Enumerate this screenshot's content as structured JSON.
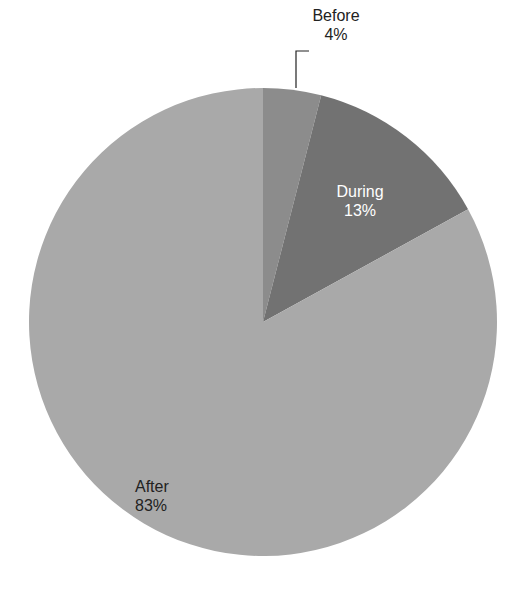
{
  "chart_data": {
    "type": "pie",
    "title": "",
    "categories": [
      "Before",
      "During",
      "After"
    ],
    "values": [
      4,
      13,
      83
    ],
    "unit": "%",
    "start_angle_deg": 0,
    "direction": "clockwise",
    "colors": [
      "#8c8c8c",
      "#727272",
      "#a9a9a9"
    ],
    "labels": [
      {
        "name": "Before",
        "value": "4%",
        "position": "outside",
        "leader_line": true,
        "text_color": "#222222"
      },
      {
        "name": "During",
        "value": "13%",
        "position": "inside",
        "text_color": "#ffffff"
      },
      {
        "name": "After",
        "value": "83%",
        "position": "inside",
        "text_color": "#222222"
      }
    ],
    "legend": null
  }
}
